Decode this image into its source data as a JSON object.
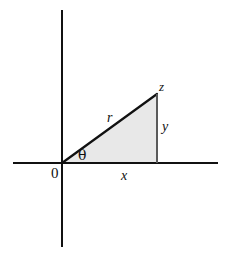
{
  "figure": {
    "name": "polar-coordinate-right-triangle",
    "background_color": "#ffffff",
    "line_color": "#111111",
    "triangle_fill_color": "#e8e8e8",
    "labels": {
      "origin": "0",
      "angle": "θ",
      "horizontal_leg": "x",
      "vertical_leg": "y",
      "hypotenuse": "r",
      "apex": "z"
    },
    "geometry": {
      "origin_point": [
        62,
        163
      ],
      "apex_point": [
        157,
        94
      ],
      "right_angle_point": [
        157,
        163
      ],
      "horizontal_axis": [
        13,
        163,
        218,
        163
      ],
      "vertical_axis": [
        62,
        10,
        62,
        247
      ]
    }
  }
}
